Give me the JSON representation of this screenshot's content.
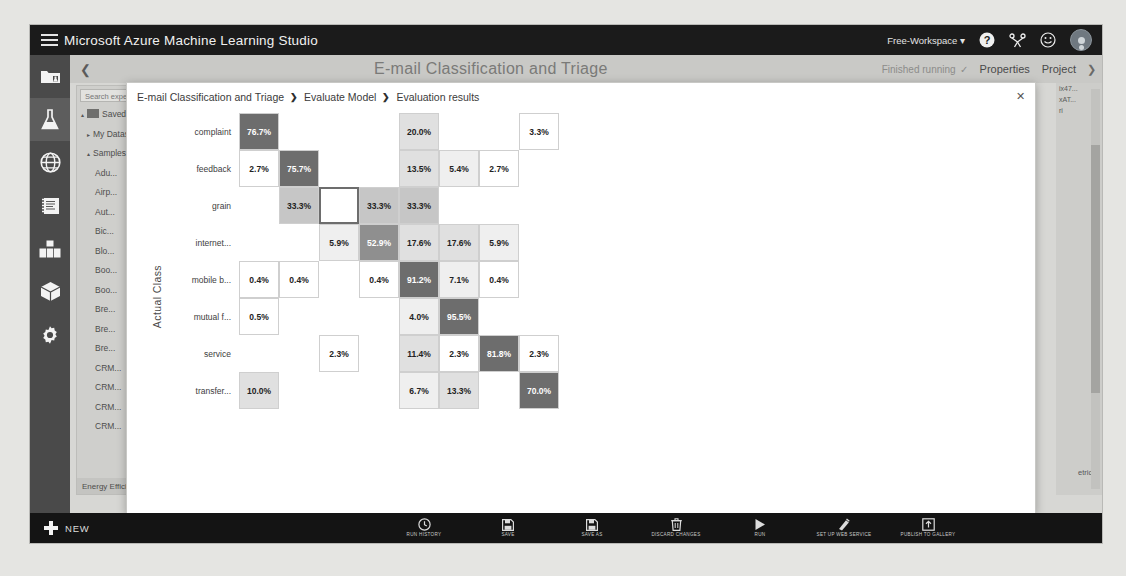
{
  "topbar": {
    "brand": "Microsoft Azure Machine Learning Studio",
    "workspace": "Free-Workspace",
    "workspace_caret": "▾",
    "help_icon": "?",
    "share_icon": "share-icon",
    "feedback_icon": "☺",
    "avatar": "user-avatar"
  },
  "rail": {
    "items": [
      {
        "name": "projects",
        "icon": "folder-flask-icon"
      },
      {
        "name": "experiments",
        "icon": "flask-icon",
        "active": true
      },
      {
        "name": "web-services",
        "icon": "globe-icon"
      },
      {
        "name": "notebooks",
        "icon": "notebook-icon"
      },
      {
        "name": "datasets",
        "icon": "datasets-icon"
      },
      {
        "name": "trained-models",
        "icon": "cube-icon"
      },
      {
        "name": "settings",
        "icon": "gear-icon"
      }
    ]
  },
  "canvas": {
    "back_caret": "❮",
    "title": "E-mail Classification and Triage",
    "run_status": "Finished running",
    "run_status_check": "✓",
    "tab_properties": "Properties",
    "tab_project": "Project",
    "right_caret": "❯",
    "module_search_placeholder": "Search experiment items",
    "tree": [
      {
        "label": "Saved Datasets",
        "level": 0,
        "caret": "▴",
        "icon": true
      },
      {
        "label": "My Datasets",
        "level": 1,
        "caret": "▸"
      },
      {
        "label": "Samples",
        "level": 1,
        "caret": "▴"
      },
      {
        "label": "Adu...",
        "level": 2
      },
      {
        "label": "Airp...",
        "level": 2
      },
      {
        "label": "Aut...",
        "level": 2
      },
      {
        "label": "Bic...",
        "level": 2
      },
      {
        "label": "Blo...",
        "level": 2
      },
      {
        "label": "Boo...",
        "level": 2
      },
      {
        "label": "Boo...",
        "level": 2
      },
      {
        "label": "Bre...",
        "level": 2
      },
      {
        "label": "Bre...",
        "level": 2
      },
      {
        "label": "Bre...",
        "level": 2
      },
      {
        "label": "CRM...",
        "level": 2
      },
      {
        "label": "CRM...",
        "level": 2
      },
      {
        "label": "CRM...",
        "level": 2
      },
      {
        "label": "CRM...",
        "level": 2
      }
    ],
    "tree_footer": "Energy Efficiency Re...",
    "tree_footer_caret": "▾",
    "dock": [
      "ix47...",
      "xAT...",
      "ri"
    ],
    "dock_metrics": "etrics"
  },
  "modal": {
    "breadcrumb": [
      "E-mail Classification and Triage",
      "Evaluate Model",
      "Evaluation results"
    ],
    "separator": "❯",
    "close": "✕"
  },
  "chart_data": {
    "type": "heatmap",
    "title": "Evaluation results",
    "subtype": "confusion-matrix",
    "ylabel": "Actual Class",
    "xlabel": "",
    "value_suffix": "%",
    "categories": [
      "complaint",
      "feedback",
      "grain",
      "internet...",
      "mobile b...",
      "mutual f...",
      "service",
      "transfer..."
    ],
    "row_labels": [
      "complaint",
      "feedback",
      "grain",
      "internet...",
      "mobile b...",
      "mutual f...",
      "service",
      "transfer..."
    ],
    "col_labels": [
      "complaint",
      "feedback",
      "grain",
      "internet",
      "mobile banking",
      "mutual funds",
      "service",
      "transfer"
    ],
    "colorscale": {
      "empty": "#ffffff",
      "low": "#f3f3f3",
      "mid": "#bdbdbd",
      "high": "#8a8a8a",
      "max": "#6d6d6d"
    },
    "selected_cell": {
      "row": 2,
      "col": 2
    },
    "rows": [
      {
        "label": "complaint",
        "cells": [
          "76.7%",
          "",
          "",
          "",
          "20.0%",
          "",
          "",
          "3.3%"
        ]
      },
      {
        "label": "feedback",
        "cells": [
          "2.7%",
          "75.7%",
          "",
          "",
          "13.5%",
          "5.4%",
          "2.7%",
          ""
        ]
      },
      {
        "label": "grain",
        "cells": [
          "",
          "33.3%",
          "",
          "33.3%",
          "33.3%",
          "",
          "",
          ""
        ]
      },
      {
        "label": "internet...",
        "cells": [
          "",
          "",
          "5.9%",
          "52.9%",
          "17.6%",
          "17.6%",
          "5.9%",
          ""
        ]
      },
      {
        "label": "mobile b...",
        "cells": [
          "0.4%",
          "0.4%",
          "",
          "0.4%",
          "91.2%",
          "7.1%",
          "0.4%",
          ""
        ]
      },
      {
        "label": "mutual f...",
        "cells": [
          "0.5%",
          "",
          "",
          "",
          "4.0%",
          "95.5%",
          "",
          ""
        ]
      },
      {
        "label": "service",
        "cells": [
          "",
          "",
          "2.3%",
          "",
          "11.4%",
          "2.3%",
          "81.8%",
          "2.3%"
        ]
      },
      {
        "label": "transfer...",
        "cells": [
          "10.0%",
          "",
          "",
          "",
          "6.7%",
          "13.3%",
          "",
          "70.0%"
        ]
      }
    ]
  },
  "cmdbar": {
    "new_label": "NEW",
    "items": [
      {
        "label": "RUN HISTORY",
        "icon": "clock-icon"
      },
      {
        "label": "SAVE",
        "icon": "save-icon"
      },
      {
        "label": "SAVE AS",
        "icon": "save-as-icon"
      },
      {
        "label": "DISCARD CHANGES",
        "icon": "trash-icon"
      },
      {
        "label": "RUN",
        "icon": "play-icon"
      },
      {
        "label": "SET UP WEB SERVICE",
        "icon": "webservice-icon"
      },
      {
        "label": "PUBLISH TO GALLERY",
        "icon": "publish-icon"
      }
    ]
  }
}
